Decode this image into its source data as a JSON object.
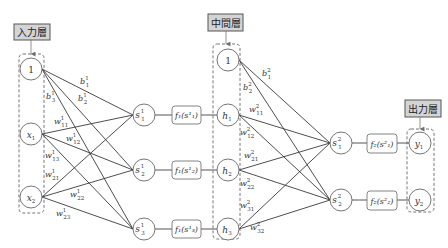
{
  "layers": {
    "input": {
      "label": "入力層",
      "nodes": [
        "1",
        "x1",
        "x2"
      ]
    },
    "hidden": {
      "label": "中間層",
      "nodes": [
        "1",
        "h1",
        "h2",
        "h3"
      ]
    },
    "output": {
      "label": "出力層",
      "nodes": [
        "y1",
        "y2"
      ]
    }
  },
  "sum_nodes_1": [
    {
      "base": "s",
      "sup": "1",
      "sub": "1"
    },
    {
      "base": "s",
      "sup": "1",
      "sub": "2"
    },
    {
      "base": "s",
      "sup": "1",
      "sub": "3"
    }
  ],
  "activation_1": [
    {
      "text": "f₁(s¹₁)"
    },
    {
      "text": "f₁(s¹₂)"
    },
    {
      "text": "f₁(s¹₃)"
    }
  ],
  "sum_nodes_2": [
    {
      "base": "s",
      "sup": "2",
      "sub": "1"
    },
    {
      "base": "s",
      "sup": "2",
      "sub": "2"
    }
  ],
  "activation_2": [
    {
      "text": "f₂(s²₁)"
    },
    {
      "text": "f₂(s²₂)"
    }
  ],
  "weights_1": [
    {
      "base": "b",
      "sup": "1",
      "sub": "1"
    },
    {
      "base": "b",
      "sup": "1",
      "sub": "2"
    },
    {
      "base": "b",
      "sup": "1",
      "sub": "3"
    },
    {
      "base": "w",
      "sup": "1",
      "sub": "11"
    },
    {
      "base": "w",
      "sup": "1",
      "sub": "12"
    },
    {
      "base": "w",
      "sup": "1",
      "sub": "13"
    },
    {
      "base": "w",
      "sup": "1",
      "sub": "21"
    },
    {
      "base": "w",
      "sup": "1",
      "sub": "22"
    },
    {
      "base": "w",
      "sup": "1",
      "sub": "23"
    }
  ],
  "weights_2": [
    {
      "base": "b",
      "sup": "2",
      "sub": "1"
    },
    {
      "base": "b",
      "sup": "2",
      "sub": "2"
    },
    {
      "base": "w",
      "sup": "2",
      "sub": "11"
    },
    {
      "base": "w",
      "sup": "2",
      "sub": "12"
    },
    {
      "base": "w",
      "sup": "2",
      "sub": "21"
    },
    {
      "base": "w",
      "sup": "2",
      "sub": "22"
    },
    {
      "base": "w",
      "sup": "2",
      "sub": "31"
    },
    {
      "base": "w",
      "sup": "2",
      "sub": "32"
    }
  ]
}
